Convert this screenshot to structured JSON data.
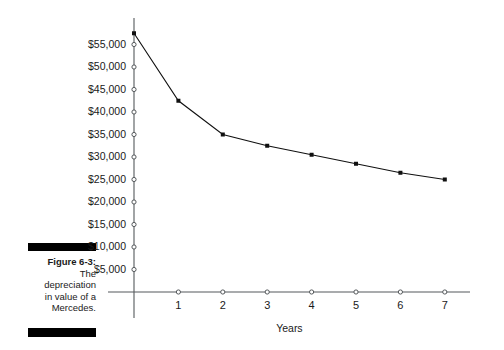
{
  "figure": {
    "label": "Figure 6-3:",
    "caption_lines": [
      "The",
      "depreciation",
      "in value of a",
      "Mercedes."
    ],
    "caption_full": "Figure 6-3: The depreciation in value of a Mercedes."
  },
  "colors": {
    "axis": "#55595c",
    "line": "#101010",
    "marker": "#101010",
    "rule": "#000000",
    "background": "#ffffff"
  },
  "chart_data": {
    "type": "line",
    "title": "",
    "xlabel": "Years",
    "ylabel": "",
    "x": [
      0,
      1,
      2,
      3,
      4,
      5,
      6,
      7
    ],
    "values": [
      57500,
      42500,
      35000,
      32500,
      30500,
      28500,
      26500,
      25000
    ],
    "series": [
      {
        "name": "Value of a Mercedes",
        "values": [
          57500,
          42500,
          35000,
          32500,
          30500,
          28500,
          26500,
          25000
        ]
      }
    ],
    "categories": [
      "0",
      "1",
      "2",
      "3",
      "4",
      "5",
      "6",
      "7"
    ],
    "xtick_labels": [
      "1",
      "2",
      "3",
      "4",
      "5",
      "6",
      "7"
    ],
    "xtick_values": [
      1,
      2,
      3,
      4,
      5,
      6,
      7
    ],
    "ytick_labels": [
      "$55,000",
      "$50,000",
      "$45,000",
      "$40,000",
      "$35,000",
      "$30,000",
      "$25,000",
      "$20,000",
      "$15,000",
      "$10,000",
      "$5,000"
    ],
    "ytick_values": [
      55000,
      50000,
      45000,
      40000,
      35000,
      30000,
      25000,
      20000,
      15000,
      10000,
      5000
    ],
    "xlim": [
      0,
      7.5
    ],
    "ylim": [
      0,
      58000
    ],
    "grid": false,
    "legend": false,
    "legend_position": "none",
    "marker_style": "filled-square",
    "annotations": []
  }
}
